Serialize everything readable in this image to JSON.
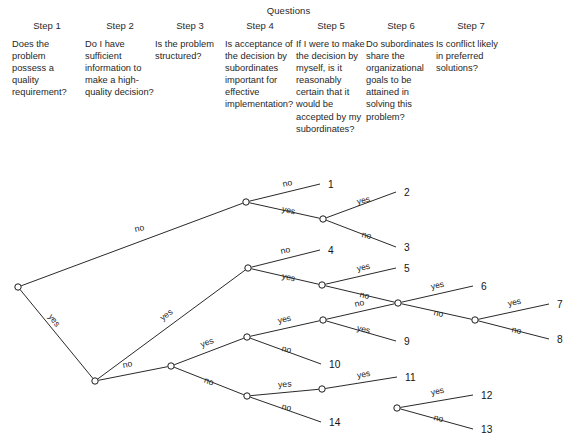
{
  "header": {
    "title": "Questions",
    "steps": [
      {
        "step_label": "Step 1",
        "question": "Does the problem possess a quality requirement?"
      },
      {
        "step_label": "Step 2",
        "question": "Do I have sufficient information to make a high-quality decision?"
      },
      {
        "step_label": "Step 3",
        "question": "Is the problem structured?"
      },
      {
        "step_label": "Step 4",
        "question": "Is acceptance of the decision by subordinates important for effective implementation?"
      },
      {
        "step_label": "Step 5",
        "question": "If I were to make the decision by myself, is it reasonably certain that it would be accepted by my subordinates?"
      },
      {
        "step_label": "Step 6",
        "question": "Do subordinates share the organizational goals to be attained in solving this problem?"
      },
      {
        "step_label": "Step 7",
        "question": "Is conflict likely in preferred solutions?"
      }
    ]
  },
  "tree": {
    "line_color": "#1d1d1d",
    "node_fill": "#ffffff",
    "nodes": [
      {
        "id": "n1",
        "x": 18,
        "y": 287
      },
      {
        "id": "n2",
        "x": 95,
        "y": 381
      },
      {
        "id": "n3",
        "x": 171,
        "y": 366
      },
      {
        "id": "n4",
        "x": 246,
        "y": 202
      },
      {
        "id": "n5",
        "x": 323,
        "y": 219
      },
      {
        "id": "n6",
        "x": 248,
        "y": 268
      },
      {
        "id": "n7",
        "x": 322,
        "y": 285
      },
      {
        "id": "n8",
        "x": 398,
        "y": 303
      },
      {
        "id": "n9",
        "x": 475,
        "y": 320
      },
      {
        "id": "n10",
        "x": 323,
        "y": 320
      },
      {
        "id": "n11",
        "x": 247,
        "y": 337
      },
      {
        "id": "n12",
        "x": 247,
        "y": 396
      },
      {
        "id": "n13",
        "x": 322,
        "y": 389
      },
      {
        "id": "n14",
        "x": 397,
        "y": 408
      }
    ],
    "edges": [
      {
        "from": "n1",
        "to": "n4",
        "label": "no",
        "lx": 140,
        "ly": 231,
        "rot": -12
      },
      {
        "from": "n1",
        "to": "n2",
        "label": "yes",
        "lx": 52,
        "ly": 322,
        "rot": 52
      },
      {
        "from": "n2",
        "to": "n6",
        "label": "yes",
        "lx": 168,
        "ly": 317,
        "rot": -38
      },
      {
        "from": "n2",
        "to": "n3",
        "label": "no",
        "lx": 128,
        "ly": 367,
        "rot": -11
      },
      {
        "from": "n4",
        "to": "out1",
        "label": "no",
        "lx": 288,
        "ly": 186,
        "rot": -13
      },
      {
        "from": "n4",
        "to": "n5",
        "label": "yes",
        "lx": 288,
        "ly": 213,
        "rot": 13
      },
      {
        "from": "n5",
        "to": "out2",
        "label": "yes",
        "lx": 364,
        "ly": 203,
        "rot": -13
      },
      {
        "from": "n5",
        "to": "out3",
        "label": "no",
        "lx": 366,
        "ly": 238,
        "rot": 13
      },
      {
        "from": "n6",
        "to": "out4",
        "label": "no",
        "lx": 286,
        "ly": 253,
        "rot": -13
      },
      {
        "from": "n6",
        "to": "n7",
        "label": "yes",
        "lx": 288,
        "ly": 280,
        "rot": 13
      },
      {
        "from": "n7",
        "to": "out5",
        "label": "yes",
        "lx": 364,
        "ly": 270,
        "rot": -13
      },
      {
        "from": "n7",
        "to": "n8",
        "label": "no",
        "lx": 364,
        "ly": 298,
        "rot": 13
      },
      {
        "from": "n8",
        "to": "out6",
        "label": "yes",
        "lx": 438,
        "ly": 288,
        "rot": -13
      },
      {
        "from": "n8",
        "to": "n9",
        "label": "no",
        "lx": 438,
        "ly": 316,
        "rot": 13
      },
      {
        "from": "n9",
        "to": "out7",
        "label": "yes",
        "lx": 515,
        "ly": 305,
        "rot": -13
      },
      {
        "from": "n9",
        "to": "out8",
        "label": "no",
        "lx": 516,
        "ly": 333,
        "rot": 13
      },
      {
        "from": "n11",
        "to": "n10",
        "label": "yes",
        "lx": 285,
        "ly": 322,
        "rot": -13
      },
      {
        "from": "n11",
        "to": "out10",
        "label": "no",
        "lx": 286,
        "ly": 352,
        "rot": 13
      },
      {
        "from": "n10",
        "to": "n8",
        "label": "no",
        "lx": 360,
        "ly": 306,
        "rot": -13
      },
      {
        "from": "n10",
        "to": "out9",
        "label": "yes",
        "lx": 363,
        "ly": 332,
        "rot": 13
      },
      {
        "from": "n3",
        "to": "n11",
        "label": "yes",
        "lx": 208,
        "ly": 345,
        "rot": -21
      },
      {
        "from": "n3",
        "to": "n12",
        "label": "no",
        "lx": 208,
        "ly": 384,
        "rot": 21
      },
      {
        "from": "n12",
        "to": "n13",
        "label": "yes",
        "lx": 285,
        "ly": 387,
        "rot": -5
      },
      {
        "from": "n12",
        "to": "out14",
        "label": "no",
        "lx": 286,
        "ly": 410,
        "rot": 13
      },
      {
        "from": "n13",
        "to": "out11",
        "label": "yes",
        "lx": 364,
        "ly": 377,
        "rot": -10
      },
      {
        "from": "n13",
        "to": "out12",
        "label": "no",
        "lx": 360,
        "ly": 400,
        "rot": 13
      },
      {
        "from": "n14",
        "to": "out12b",
        "label": "yes",
        "lx": 438,
        "ly": 394,
        "rot": -13
      },
      {
        "from": "n14",
        "to": "out13",
        "label": "no",
        "lx": 438,
        "ly": 421,
        "rot": 13
      }
    ],
    "outcomes": [
      {
        "id": "out1",
        "label": "1",
        "ex": 320,
        "ey": 184,
        "tx": 328,
        "ty": 184
      },
      {
        "id": "out2",
        "label": "2",
        "ex": 396,
        "ey": 192,
        "tx": 404,
        "ty": 192
      },
      {
        "id": "out3",
        "label": "3",
        "ex": 396,
        "ey": 247,
        "tx": 404,
        "ty": 247
      },
      {
        "id": "out4",
        "label": "4",
        "ex": 320,
        "ey": 250,
        "tx": 328,
        "ty": 250
      },
      {
        "id": "out5",
        "label": "5",
        "ex": 396,
        "ey": 268,
        "tx": 404,
        "ty": 268
      },
      {
        "id": "out6",
        "label": "6",
        "ex": 473,
        "ey": 286,
        "tx": 481,
        "ty": 286
      },
      {
        "id": "out7",
        "label": "7",
        "ex": 549,
        "ey": 304,
        "tx": 557,
        "ty": 304
      },
      {
        "id": "out8",
        "label": "8",
        "ex": 549,
        "ey": 339,
        "tx": 557,
        "ty": 339
      },
      {
        "id": "out9",
        "label": "9",
        "ex": 396,
        "ey": 341,
        "tx": 404,
        "ty": 341
      },
      {
        "id": "out10",
        "label": "10",
        "ex": 321,
        "ey": 364,
        "tx": 329,
        "ty": 364
      },
      {
        "id": "out11",
        "label": "11",
        "ex": 397,
        "ey": 377,
        "tx": 405,
        "ty": 377
      },
      {
        "id": "out12b",
        "label": "12",
        "ex": 473,
        "ey": 395,
        "tx": 481,
        "ty": 395
      },
      {
        "id": "out13",
        "label": "13",
        "ex": 473,
        "ey": 429,
        "tx": 481,
        "ty": 429
      },
      {
        "id": "out14",
        "label": "14",
        "ex": 321,
        "ey": 422,
        "tx": 329,
        "ty": 422
      }
    ]
  }
}
